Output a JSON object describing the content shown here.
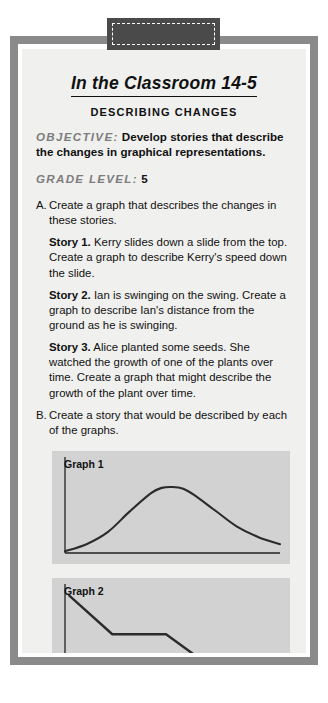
{
  "worksheet": {
    "tab": {
      "name": "dashed-tab"
    },
    "title": "In the Classroom 14-5",
    "subtitle": "DESCRIBING CHANGES",
    "objective": {
      "label": "OBJECTIVE:",
      "text": "Develop stories that describe the changes in graphical representations."
    },
    "grade_level": {
      "label": "GRADE LEVEL:",
      "value": "5"
    },
    "items": [
      {
        "marker": "A.",
        "text": "Create a graph that describes the changes in these stories.",
        "stories": [
          {
            "label": "Story 1.",
            "text": "Kerry slides down a slide from the top. Create a graph to describe Kerry's speed down the slide."
          },
          {
            "label": "Story 2.",
            "text": "Ian is swinging on the swing. Create a graph to describe Ian's distance from the ground as he is swinging."
          },
          {
            "label": "Story 3.",
            "text": "Alice planted some seeds. She watched the growth of one of the plants over time. Create a graph that might describe the growth of the plant over time."
          }
        ]
      },
      {
        "marker": "B.",
        "text": "Create a story that would be described by each of the graphs.",
        "stories": []
      }
    ],
    "graphs": [
      {
        "label": "Graph 1"
      },
      {
        "label": "Graph 2"
      }
    ],
    "colors": {
      "frame": "#8a8a8a",
      "sheet": "#f0f0ef",
      "graph_bg": "#d2d2d2",
      "tab": "#4a4a4a",
      "meta_label": "#7d7d7d",
      "ink": "#111111"
    }
  },
  "chart_data": [
    {
      "type": "line",
      "title": "Graph 1",
      "xlabel": "",
      "ylabel": "",
      "xlim": [
        0,
        100
      ],
      "ylim": [
        0,
        100
      ],
      "grid": false,
      "legend": "none",
      "description": "smooth bell-shaped curve rising from near zero, peaking slightly left of center, then falling",
      "x": [
        0,
        10,
        20,
        30,
        40,
        45,
        50,
        55,
        60,
        70,
        80,
        90,
        100
      ],
      "y": [
        2,
        10,
        24,
        47,
        68,
        74,
        75,
        73,
        66,
        48,
        30,
        18,
        10
      ]
    },
    {
      "type": "line",
      "title": "Graph 2",
      "xlabel": "",
      "ylabel": "",
      "xlim": [
        0,
        100
      ],
      "ylim": [
        0,
        100
      ],
      "grid": false,
      "legend": "none",
      "description": "descending piecewise-linear staircase: steep drop, flat, drop, flat, drop to baseline",
      "x": [
        2,
        22,
        47,
        65,
        88,
        100
      ],
      "y": [
        96,
        52,
        52,
        20,
        20,
        2
      ]
    }
  ]
}
